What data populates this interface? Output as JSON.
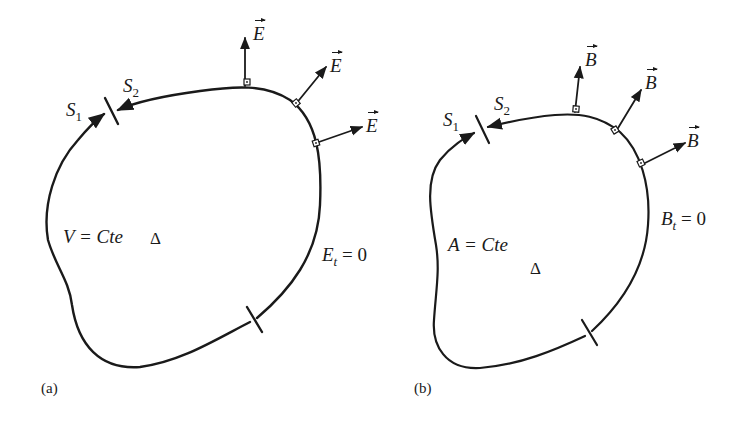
{
  "figure_a": {
    "panel_label": "(a)",
    "boundary_label_1": "S",
    "boundary_label_1_sub": "1",
    "boundary_label_2": "S",
    "boundary_label_2_sub": "2",
    "potential_condition": "V = Cte",
    "domain_symbol": "Δ",
    "tangential_condition": "E",
    "tangential_condition_sub": "t",
    "tangential_condition_rhs": " = 0",
    "field_vectors": [
      "E",
      "E",
      "E"
    ]
  },
  "figure_b": {
    "panel_label": "(b)",
    "boundary_label_1": "S",
    "boundary_label_1_sub": "1",
    "boundary_label_2": "S",
    "boundary_label_2_sub": "2",
    "potential_condition": "A = Cte",
    "domain_symbol": "Δ",
    "tangential_condition": "B",
    "tangential_condition_sub": "t",
    "tangential_condition_rhs": " = 0",
    "field_vectors": [
      "B",
      "B",
      "B"
    ]
  },
  "colors": {
    "stroke": "#1a1a1a",
    "background": "#ffffff"
  }
}
